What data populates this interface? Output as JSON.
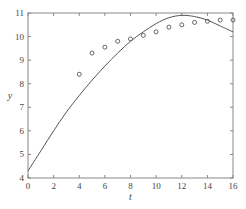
{
  "chart_data": {
    "type": "scatter+line",
    "title": "",
    "xlabel": "t",
    "ylabel": "y",
    "xlim": [
      0,
      16
    ],
    "ylim": [
      4,
      11
    ],
    "xticks": [
      0,
      2,
      4,
      6,
      8,
      10,
      12,
      14,
      16
    ],
    "yticks": [
      4,
      5,
      6,
      7,
      8,
      9,
      10,
      11
    ],
    "grid": false,
    "legend": null,
    "series": [
      {
        "name": "data",
        "type": "scatter",
        "marker": "open-circle",
        "x": [
          4,
          5,
          6,
          7,
          8,
          9,
          10,
          11,
          12,
          13,
          14,
          15,
          16
        ],
        "y": [
          8.4,
          9.3,
          9.55,
          9.8,
          9.9,
          10.05,
          10.2,
          10.4,
          10.5,
          10.6,
          10.65,
          10.7,
          10.7
        ]
      },
      {
        "name": "model",
        "type": "line",
        "x": [
          0,
          1,
          2,
          3,
          4,
          5,
          6,
          7,
          8,
          9,
          10,
          11,
          12,
          13,
          14,
          15,
          16
        ],
        "y": [
          4.3,
          5.15,
          6.0,
          6.8,
          7.5,
          8.15,
          8.75,
          9.3,
          9.8,
          10.2,
          10.55,
          10.8,
          10.9,
          10.85,
          10.7,
          10.45,
          10.2
        ]
      }
    ]
  },
  "colors": {
    "axis": "#888888",
    "line": "#555555",
    "marker": "#555555"
  }
}
